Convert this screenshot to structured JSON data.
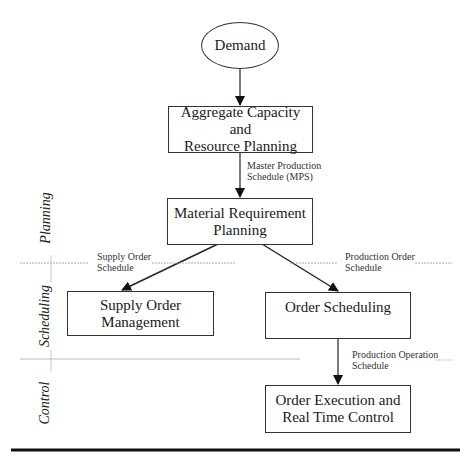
{
  "nodes": {
    "demand": "Demand",
    "aggregate": {
      "line1": "Aggregate Capacity and",
      "line2": "Resource Planning"
    },
    "mrp": {
      "line1": "Material Requirement",
      "line2": "Planning"
    },
    "supply": {
      "line1": "Supply Order",
      "line2": "Management"
    },
    "order_scheduling": "Order Scheduling",
    "execution": {
      "line1": "Order Execution and",
      "line2": "Real Time Control"
    }
  },
  "edge_labels": {
    "mps": {
      "line1": "Master Production",
      "line2": "Schedule (MPS)"
    },
    "supply_schedule": {
      "line1": "Supply Order",
      "line2": "Schedule"
    },
    "production_order": {
      "line1": "Production Order",
      "line2": "Schedule"
    },
    "production_operation": {
      "line1": "Production Operation",
      "line2": "Schedule"
    }
  },
  "phases": [
    "Planning",
    "Scheduling",
    "Control"
  ]
}
